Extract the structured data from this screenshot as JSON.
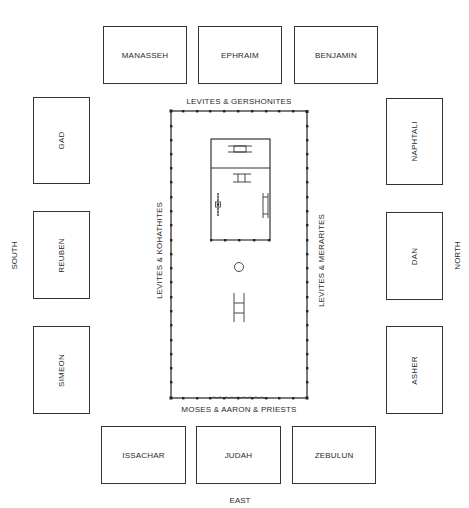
{
  "directions": {
    "south": "SOUTH",
    "north": "NORTH",
    "east": "EAST"
  },
  "tribes": {
    "west": [
      "MANASSEH",
      "EPHRAIM",
      "BENJAMIN"
    ],
    "south": [
      "GAD",
      "REUBEN",
      "SIMEON"
    ],
    "north": [
      "NAPHTALI",
      "DAN",
      "ASHER"
    ],
    "east": [
      "ISSACHAR",
      "JUDAH",
      "ZEBULUN"
    ]
  },
  "levites": {
    "west": "LEVITES & GERSHONITES",
    "south": "LEVITES & KOHATHITES",
    "north": "LEVITES & MERARITES",
    "east": "MOSES & AARON & PRIESTS"
  },
  "colors": {
    "line": "#333333",
    "text": "#2a2a2a"
  }
}
